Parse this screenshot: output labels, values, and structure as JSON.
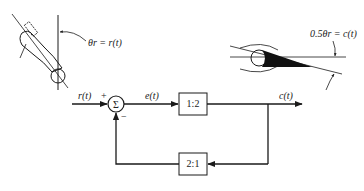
{
  "figure": {
    "top_left_illustration": {
      "description": "reference arm angle",
      "annotation": "θr = r(t)"
    },
    "top_right_illustration": {
      "description": "output wedge angle",
      "annotation": "0.5θr = c(t)"
    },
    "block_diagram": {
      "input_label": "r(t)",
      "summing_junction_symbol": "Σ",
      "plus_sign": "+",
      "minus_sign": "−",
      "error_label": "e(t)",
      "forward_block": "1:2",
      "output_label": "c(t)",
      "feedback_block": "2:1"
    }
  },
  "colors": {
    "line": "#1a1a1a",
    "background": "#ffffff"
  }
}
